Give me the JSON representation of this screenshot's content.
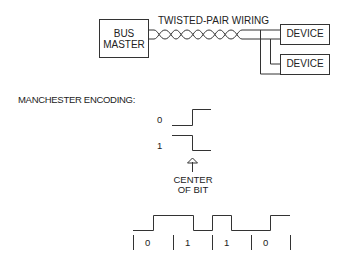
{
  "bus": {
    "master_line1": "BUS",
    "master_line2": "MASTER",
    "wiring_label": "TWISTED-PAIR WIRING",
    "devices": [
      "DEVICE",
      "DEVICE"
    ]
  },
  "encoding": {
    "title": "MANCHESTER ENCODING:",
    "legend": [
      {
        "bit": "0",
        "transition": "low-to-high"
      },
      {
        "bit": "1",
        "transition": "high-to-low"
      }
    ],
    "arrow_label_line1": "CENTER",
    "arrow_label_line2": "OF BIT",
    "sequence": [
      "0",
      "1",
      "1",
      "0"
    ]
  },
  "colors": {
    "stroke": "#333333",
    "background": "#ffffff"
  }
}
